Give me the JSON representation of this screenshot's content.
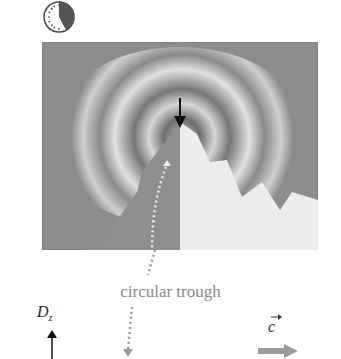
{
  "clock": {
    "icon": "clock-icon",
    "elapsed_fraction": 0.42
  },
  "panel": {
    "description": "3D surface with concentric circular troughs, cut-away quadrant"
  },
  "annotations": {
    "trough_label": "circular trough",
    "dz_label": "D",
    "dz_subscript": "z",
    "c_label": "c",
    "c_vector_mark": "→"
  },
  "colors": {
    "panel_bg": "#8c8c8c",
    "cut_face": "#ececec",
    "dotted_arrow": "#9a9a9a",
    "c_arrow": "#9a9a9a"
  }
}
